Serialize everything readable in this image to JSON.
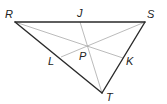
{
  "diagram": {
    "type": "geometry-triangle",
    "colors": {
      "side": "#2a2a2a",
      "cevian": "#aaaaaa",
      "label": "#222222"
    },
    "vertices": {
      "R": {
        "x": 15,
        "y": 22,
        "label": "R",
        "lx": 5,
        "ly": 18
      },
      "S": {
        "x": 145,
        "y": 22,
        "label": "S",
        "lx": 147,
        "ly": 18
      },
      "T": {
        "x": 102,
        "y": 93,
        "label": "T",
        "lx": 106,
        "ly": 101
      }
    },
    "points": {
      "J": {
        "x": 80,
        "y": 22,
        "label": "J",
        "lx": 77,
        "ly": 17
      },
      "K": {
        "x": 123,
        "y": 58,
        "label": "K",
        "lx": 126,
        "ly": 65
      },
      "L": {
        "x": 61,
        "y": 57,
        "label": "L",
        "lx": 48,
        "ly": 65
      },
      "P": {
        "x": 87,
        "y": 46,
        "label": "P",
        "lx": 79,
        "ly": 60
      }
    },
    "sides": [
      "RS",
      "ST",
      "TR"
    ],
    "cevians": [
      "RK",
      "SL",
      "TJ"
    ]
  }
}
